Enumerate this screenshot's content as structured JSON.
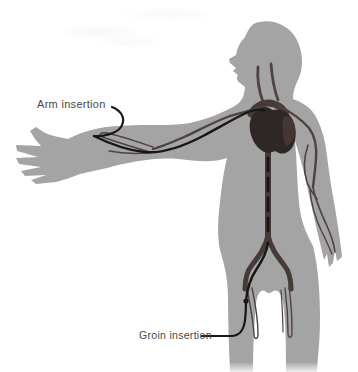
{
  "figure": {
    "labels": {
      "arm": "Arm insertion",
      "groin": "Groin insertion"
    }
  },
  "colors": {
    "background": "#ffffff",
    "body": "#a4a4a4",
    "vessel": "#4f4341",
    "vessel_dark": "#453a38",
    "heart": "#2f2726",
    "heart_light": "#443634",
    "catheter": "#171717",
    "label_text": "#474747"
  }
}
